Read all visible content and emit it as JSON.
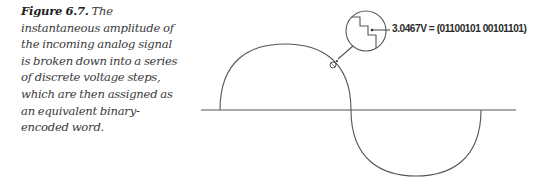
{
  "caption": {
    "figure_label": "Figure 6.7.",
    "text": " The instantaneous amplitude of the incoming analog signal is broken down into a series of discrete voltage steps, which are then assigned as an equivalent binary-encoded word."
  },
  "figure": {
    "sample_annotation": "3.0467V = (01100101 00101101)",
    "stroke_color": "#555555",
    "axis": {
      "x1": 201,
      "x2": 516,
      "y": 110
    },
    "positive_half_cycle": {
      "start_x": 220,
      "end_x": 351,
      "peak_y": 44
    },
    "negative_half_cycle": {
      "start_x": 351,
      "end_x": 481,
      "trough_y": 176
    },
    "sample_point": {
      "x": 333,
      "y": 65
    },
    "magnifier": {
      "cx": 366,
      "cy": 31,
      "r": 20
    }
  }
}
